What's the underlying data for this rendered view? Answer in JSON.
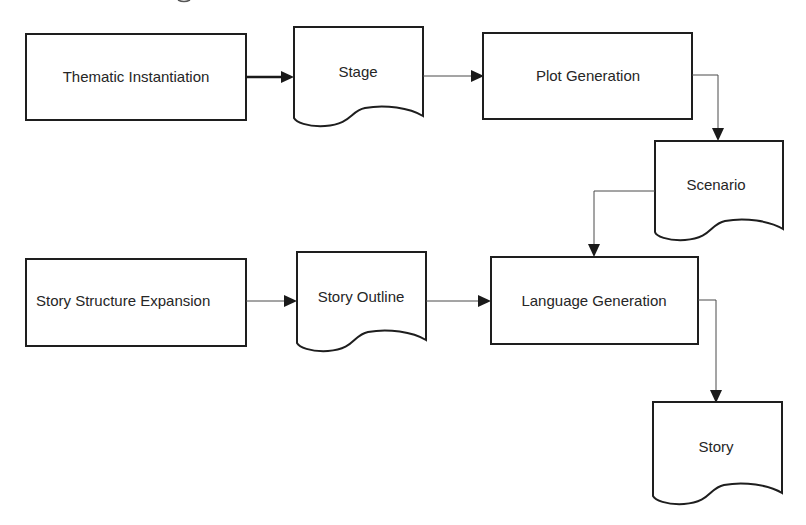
{
  "diagram": {
    "type": "flowchart",
    "nodes": {
      "thematic_instantiation": {
        "label": "Thematic Instantiation",
        "shape": "process"
      },
      "stage": {
        "label": "Stage",
        "shape": "document"
      },
      "plot_generation": {
        "label": "Plot Generation",
        "shape": "process"
      },
      "scenario": {
        "label": "Scenario",
        "shape": "document"
      },
      "story_structure_expansion": {
        "label": "Story Structure Expansion",
        "shape": "process"
      },
      "story_outline": {
        "label": "Story Outline",
        "shape": "document"
      },
      "language_generation": {
        "label": "Language Generation",
        "shape": "process"
      },
      "story": {
        "label": "Story",
        "shape": "document"
      }
    },
    "edges": [
      {
        "from": "Thematic Instantiation",
        "to": "Stage"
      },
      {
        "from": "Stage",
        "to": "Plot Generation"
      },
      {
        "from": "Plot Generation",
        "to": "Scenario"
      },
      {
        "from": "Scenario",
        "to": "Language Generation"
      },
      {
        "from": "Story Structure Expansion",
        "to": "Story Outline"
      },
      {
        "from": "Story Outline",
        "to": "Language Generation"
      },
      {
        "from": "Language Generation",
        "to": "Story"
      }
    ],
    "colors": {
      "stroke": "#1e1e1e",
      "text": "#262626",
      "background": "#ffffff"
    }
  }
}
